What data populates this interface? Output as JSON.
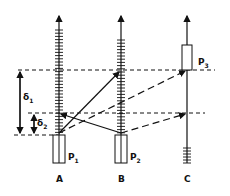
{
  "diagram": {
    "type": "timing-diagram",
    "columns": [
      {
        "id": "A",
        "label": "A",
        "processor": "P",
        "processor_sub": "1"
      },
      {
        "id": "B",
        "label": "B",
        "processor": "P",
        "processor_sub": "2"
      },
      {
        "id": "C",
        "label": "C",
        "processor": "P",
        "processor_sub": "3"
      }
    ],
    "intervals": [
      {
        "symbol": "δ",
        "sub": "1"
      },
      {
        "symbol": "δ",
        "sub": "2"
      }
    ],
    "messages": [
      {
        "from": "A",
        "to": "B",
        "style": "solid"
      },
      {
        "from": "B",
        "to": "A",
        "style": "solid"
      },
      {
        "from": "A",
        "to": "C",
        "style": "dashed"
      },
      {
        "from": "B",
        "to": "C",
        "style": "dashed"
      }
    ],
    "colors": {
      "ink": "#111111",
      "background": "#ffffff"
    }
  }
}
